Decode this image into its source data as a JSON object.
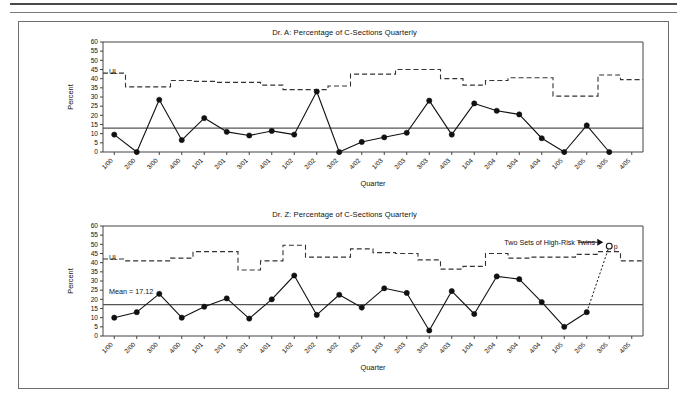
{
  "page": {
    "header_rule_visible": true,
    "figure_border_color": "#6d6d6d",
    "background": "#ffffff"
  },
  "axis": {
    "y_label": "Percent",
    "x_label": "Quarter",
    "y_ticks": [
      0,
      5,
      10,
      15,
      20,
      25,
      30,
      35,
      40,
      45,
      50,
      55,
      60
    ],
    "y_min": 0,
    "y_max": 60,
    "categories": [
      "1/00",
      "2/00",
      "3/00",
      "4/00",
      "1/01",
      "2/01",
      "3/01",
      "4/01",
      "1/02",
      "2/02",
      "3/02",
      "4/02",
      "1/03",
      "2/03",
      "3/03",
      "4/03",
      "1/04",
      "2/04",
      "3/04",
      "4/04",
      "1/05",
      "2/05",
      "3/05",
      "4/05"
    ]
  },
  "chart_data": [
    {
      "type": "line",
      "title": "Dr. A: Percentage of C-Sections Quarterly",
      "xlabel": "Quarter",
      "ylabel": "Percent",
      "ylim": [
        0,
        60
      ],
      "grid": false,
      "legend": "none",
      "categories": [
        "1/00",
        "2/00",
        "3/00",
        "4/00",
        "1/01",
        "2/01",
        "3/01",
        "4/01",
        "1/02",
        "2/02",
        "3/02",
        "4/02",
        "1/03",
        "2/03",
        "3/03",
        "4/03",
        "1/04",
        "2/04",
        "3/04",
        "4/04",
        "1/05",
        "2/05",
        "3/05",
        "4/05"
      ],
      "series": [
        {
          "name": "Percentage of C-Sections",
          "style": "solid-marker",
          "values": [
            9.5,
            0,
            28.5,
            6.5,
            18.5,
            11,
            9,
            11.5,
            9.5,
            33,
            0,
            5.5,
            8,
            10.5,
            28,
            9.5,
            26.5,
            22.5,
            20.5,
            7.5,
            0,
            14.5,
            0,
            null
          ]
        },
        {
          "name": "UL",
          "style": "dashed-step",
          "label": "UL",
          "values": [
            43,
            35.5,
            35.5,
            39,
            38.5,
            38,
            38,
            36.5,
            34,
            34,
            36,
            42.5,
            42.5,
            45,
            45,
            40,
            36.5,
            39,
            40.5,
            40.5,
            30.5,
            30.5,
            42,
            39.5
          ]
        }
      ],
      "mean_line": 13,
      "annotations": []
    },
    {
      "type": "line",
      "title": "Dr. Z: Percentage of C-Sections Quarterly",
      "xlabel": "Quarter",
      "ylabel": "Percent",
      "ylim": [
        0,
        60
      ],
      "grid": false,
      "legend": "none",
      "categories": [
        "1/00",
        "2/00",
        "3/00",
        "4/00",
        "1/01",
        "2/01",
        "3/01",
        "4/01",
        "1/02",
        "2/02",
        "3/02",
        "4/02",
        "1/03",
        "2/03",
        "3/03",
        "4/03",
        "1/04",
        "2/04",
        "3/04",
        "4/04",
        "1/05",
        "2/05",
        "3/05",
        "4/05"
      ],
      "series": [
        {
          "name": "Percentage of C-Sections",
          "style": "solid-marker",
          "values": [
            10,
            13,
            23,
            10,
            16,
            20.5,
            9.5,
            20,
            33,
            11.5,
            22.5,
            15.5,
            26,
            23.5,
            3,
            24.5,
            12,
            32.5,
            31,
            18.5,
            5,
            13,
            49,
            null
          ]
        },
        {
          "name": "UL",
          "style": "dashed-step",
          "label": "UL",
          "values": [
            42,
            41,
            41,
            42.5,
            46,
            46,
            36,
            41,
            49.5,
            43,
            43,
            47.5,
            45.5,
            45,
            41.5,
            36.5,
            38,
            45,
            42.5,
            43,
            43,
            44.5,
            46,
            41
          ]
        }
      ],
      "mean_line": 17.12,
      "mean_label": "Mean = 17.12",
      "annotations": [
        {
          "text": "Two Sets of High-Risk Twins",
          "target_category": "3/05",
          "target_value": 49,
          "point_label": "p",
          "point_style": "open-circle",
          "connector": "dotted"
        }
      ]
    }
  ],
  "colors": {
    "line": "#111111",
    "marker": "#111111",
    "ul_line": "#333333",
    "mean_line": "#555555",
    "axis": "#444444",
    "frame": "#6d6d6d"
  }
}
